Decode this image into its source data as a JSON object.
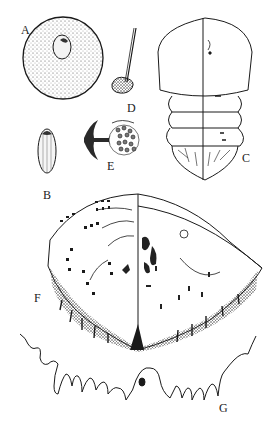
{
  "figure": {
    "ink_color": "#1a1a1a",
    "background": "#ffffff",
    "panels": [
      {
        "label": "A",
        "subject": "egg (round, stippled, with embryo spot)"
      },
      {
        "label": "B",
        "subject": "elongate oval stage, striated"
      },
      {
        "label": "C",
        "subject": "body dorsal/ventral view, segmented abdomen"
      },
      {
        "label": "D",
        "subject": "mouthpart / stylet with basal bulb"
      },
      {
        "label": "E",
        "subject": "spiracle / pore plate with disc pores"
      },
      {
        "label": "F",
        "subject": "pygidium half dorsal / half ventral view"
      },
      {
        "label": "G",
        "subject": "anal / marginal filament outline"
      }
    ]
  }
}
